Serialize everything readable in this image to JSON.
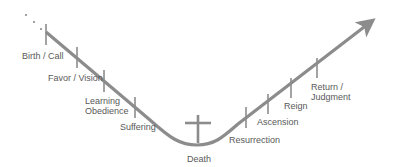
{
  "diagram": {
    "title": "",
    "colors": {
      "line": "#8c8c8c",
      "text": "#595959",
      "background": "#ffffff"
    },
    "lead_dots": [
      {
        "x": 26,
        "y": 15
      },
      {
        "x": 34,
        "y": 22
      },
      {
        "x": 41,
        "y": 29
      }
    ],
    "path": {
      "start": {
        "x": 46,
        "y": 32
      },
      "valley_bottom": {
        "x": 197,
        "y": 145
      },
      "end_arrow_tip": {
        "x": 375,
        "y": 19
      }
    },
    "cross": {
      "name": "cross-icon",
      "x": 198,
      "top": 115,
      "bottom": 143,
      "bar_y": 123,
      "bar_left": 185,
      "bar_right": 211
    },
    "stages": [
      {
        "id": "birth-call",
        "label": [
          "Birth / Call"
        ],
        "tick_x": 46,
        "tick_y1": 24,
        "tick_y2": 45,
        "label_x": 22,
        "label_y": 51
      },
      {
        "id": "favor-vision",
        "label": [
          "Favor / Vision"
        ],
        "tick_x": 77,
        "tick_y1": 47,
        "tick_y2": 68,
        "label_x": 48,
        "label_y": 73
      },
      {
        "id": "learning-obedience",
        "label": [
          "Learning",
          "Obedience"
        ],
        "tick_x": 104,
        "tick_y1": 70,
        "tick_y2": 92,
        "label_x": 85,
        "label_y": 96
      },
      {
        "id": "suffering",
        "label": [
          "Suffering"
        ],
        "tick_x": 135,
        "tick_y1": 97,
        "tick_y2": 118,
        "label_x": 120,
        "label_y": 122
      },
      {
        "id": "death",
        "label": [
          "Death"
        ],
        "tick_x": null,
        "label_x": 187,
        "label_y": 154
      },
      {
        "id": "resurrection",
        "label": [
          "Resurrection"
        ],
        "tick_x": 246,
        "tick_y1": 107,
        "tick_y2": 128,
        "label_x": 229,
        "label_y": 135
      },
      {
        "id": "ascension",
        "label": [
          "Ascension"
        ],
        "tick_x": 268,
        "tick_y1": 94,
        "tick_y2": 114,
        "label_x": 257,
        "label_y": 117
      },
      {
        "id": "reign",
        "label": [
          "Reign"
        ],
        "tick_x": 291,
        "tick_y1": 78,
        "tick_y2": 98,
        "label_x": 284,
        "label_y": 101
      },
      {
        "id": "return-judgment",
        "label": [
          "Return /",
          "Judgment"
        ],
        "tick_x": 317,
        "tick_y1": 58,
        "tick_y2": 78,
        "label_x": 311,
        "label_y": 82
      }
    ]
  }
}
